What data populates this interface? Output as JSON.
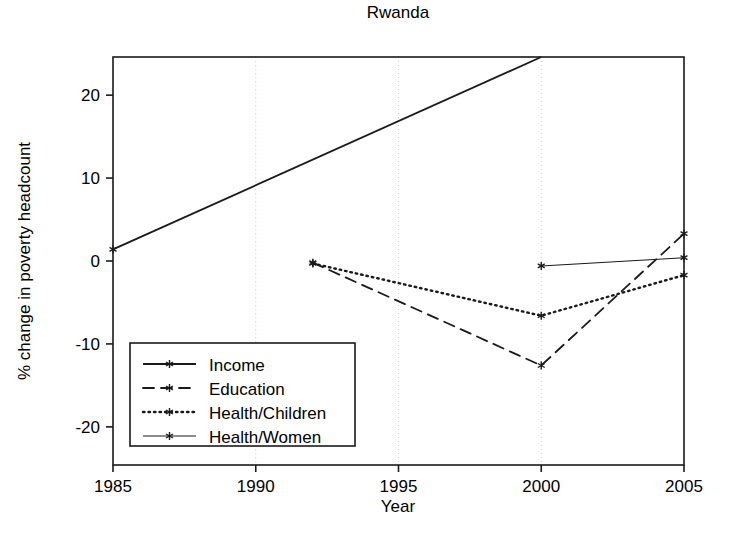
{
  "chart_data": {
    "type": "line",
    "title": "Rwanda",
    "xlabel": "Year",
    "ylabel": "% change in poverty headcount",
    "xlim": [
      1985,
      2005
    ],
    "ylim": [
      -24.6,
      24.6
    ],
    "xticks": [
      1985,
      1990,
      1995,
      2000,
      2005
    ],
    "xticklabels": [
      "1985",
      "1990",
      "1995",
      "2000",
      "2005"
    ],
    "yticks": [
      -20,
      -10,
      0,
      10,
      20
    ],
    "yticklabels": [
      "-20",
      "-10",
      "0",
      "10",
      "20"
    ],
    "grid": "vertical dotted gridlines at x ticks",
    "legend_position": "lower left inside axes",
    "series": [
      {
        "name": "Income",
        "style": "solid",
        "marker": "star",
        "x": [
          1985,
          2000
        ],
        "y": [
          1.4,
          24.6
        ],
        "note": "line exits top of plot at year 2000"
      },
      {
        "name": "Education",
        "style": "dashed",
        "marker": "star",
        "x": [
          1992,
          2000,
          2005
        ],
        "y": [
          -0.2,
          -12.6,
          3.3
        ]
      },
      {
        "name": "Health/Children",
        "style": "dotted",
        "marker": "star",
        "x": [
          1992,
          2000,
          2005
        ],
        "y": [
          -0.3,
          -6.6,
          -1.7
        ]
      },
      {
        "name": "Health/Women",
        "style": "solid-thin",
        "marker": "star",
        "x": [
          2000,
          2005
        ],
        "y": [
          -0.6,
          0.4
        ]
      }
    ]
  },
  "legend": {
    "entries": [
      {
        "label": "Income"
      },
      {
        "label": "Education"
      },
      {
        "label": "Health/Children"
      },
      {
        "label": "Health/Women"
      }
    ]
  },
  "colors": {
    "ink": "#1a1a1a",
    "grid": "#c8c8c8",
    "background": "#ffffff"
  }
}
